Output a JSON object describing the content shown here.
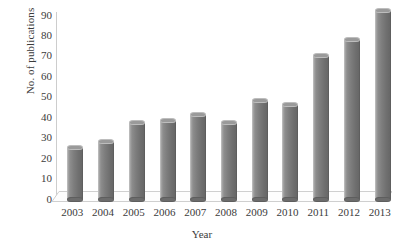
{
  "chart_data": {
    "type": "bar",
    "title": "",
    "xlabel": "Year",
    "ylabel": "No. of publications",
    "categories": [
      "2003",
      "2004",
      "2005",
      "2006",
      "2007",
      "2008",
      "2009",
      "2010",
      "2011",
      "2012",
      "2013"
    ],
    "values": [
      25,
      28,
      37,
      38,
      41,
      37,
      48,
      46,
      70,
      78,
      92
    ],
    "series": [
      {
        "name": "No. of publications",
        "values": [
          25,
          28,
          37,
          38,
          41,
          37,
          48,
          46,
          70,
          78,
          92
        ]
      }
    ],
    "ylim": [
      0,
      90
    ],
    "ytick_labels": [
      "90",
      "80",
      "70",
      "60",
      "50",
      "40",
      "30",
      "20",
      "10",
      "0"
    ],
    "ytick_values": [
      90,
      80,
      70,
      60,
      50,
      40,
      30,
      20,
      10,
      0
    ],
    "grid": false,
    "legend": false,
    "legend_position": "none",
    "style": "3d-cylinder-bars",
    "colors": {
      "bar": "#7d7d7d",
      "bar_highlight": "#a8a8a8",
      "bar_shadow": "#676767",
      "axis": "#cdcdcd",
      "text": "#3b3b3b",
      "background": "#ffffff",
      "floor": "#fcfcfc"
    }
  }
}
